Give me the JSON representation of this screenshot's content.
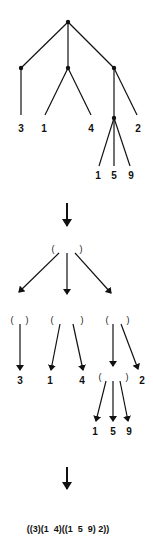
{
  "tree": {
    "leaf_labels": [
      "3",
      "1",
      "4",
      "1",
      "5",
      "9",
      "2"
    ]
  },
  "paren_tree": {
    "open": "(",
    "close": ")",
    "leaf_labels": [
      "3",
      "1",
      "4",
      "1",
      "5",
      "9",
      "2"
    ]
  },
  "result": {
    "expression": "((3)(1  4)((1  5  9) 2))"
  }
}
